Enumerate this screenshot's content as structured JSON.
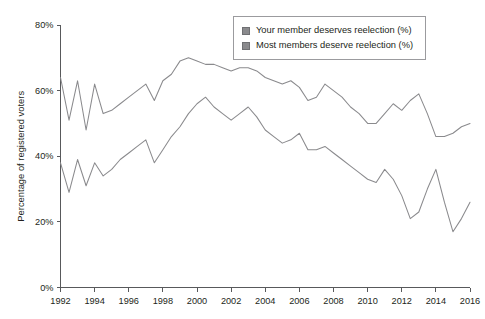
{
  "chart_data": {
    "type": "line",
    "title": "",
    "xlabel": "",
    "ylabel": "Percentage of registered voters",
    "xlim": [
      1992,
      2016
    ],
    "ylim": [
      0,
      80
    ],
    "grid": false,
    "legend_position": "top-right",
    "x_ticks": [
      "1992",
      "1994",
      "1996",
      "1998",
      "2000",
      "2002",
      "2004",
      "2006",
      "2008",
      "2010",
      "2012",
      "2014",
      "2016"
    ],
    "y_ticks": [
      "0%",
      "20%",
      "40%",
      "60%",
      "80%"
    ],
    "x": [
      1992,
      1992.5,
      1993,
      1993.5,
      1994,
      1994.5,
      1995,
      1995.5,
      1996,
      1996.5,
      1997,
      1997.5,
      1998,
      1998.5,
      1999,
      1999.5,
      2000,
      2000.5,
      2001,
      2001.5,
      2002,
      2002.5,
      2003,
      2003.5,
      2004,
      2004.5,
      2005,
      2005.5,
      2006,
      2006.5,
      2007,
      2007.5,
      2008,
      2008.5,
      2009,
      2009.5,
      2010,
      2010.5,
      2011,
      2011.5,
      2012,
      2012.5,
      2013,
      2013.5,
      2014,
      2014.5,
      2015,
      2015.5,
      2016
    ],
    "series": [
      {
        "name": "Your member deserves reelection (%)",
        "color": "#8a8a8d",
        "values": [
          64,
          51,
          63,
          48,
          62,
          53,
          54,
          56,
          58,
          60,
          62,
          57,
          63,
          65,
          69,
          70,
          69,
          68,
          68,
          67,
          66,
          67,
          67,
          66,
          64,
          63,
          62,
          63,
          61,
          57,
          58,
          62,
          60,
          58,
          55,
          53,
          50,
          50,
          53,
          56,
          54,
          57,
          59,
          53,
          46,
          46,
          47,
          49,
          50
        ]
      },
      {
        "name": "Most members deserve reelection (%)",
        "color": "#8a8a8d",
        "values": [
          38,
          29,
          39,
          31,
          38,
          34,
          36,
          39,
          41,
          43,
          45,
          38,
          42,
          46,
          49,
          53,
          56,
          58,
          55,
          53,
          51,
          53,
          55,
          52,
          48,
          46,
          44,
          45,
          47,
          42,
          42,
          43,
          41,
          39,
          37,
          35,
          33,
          32,
          36,
          33,
          28,
          21,
          23,
          30,
          36,
          26,
          17,
          21,
          26
        ]
      }
    ]
  },
  "legend": {
    "items": [
      {
        "label": "Your member deserves reelection (%)",
        "swatch_color": "#8a8a8d"
      },
      {
        "label": "Most members deserve reelection (%)",
        "swatch_color": "#8a8a8d"
      }
    ]
  }
}
